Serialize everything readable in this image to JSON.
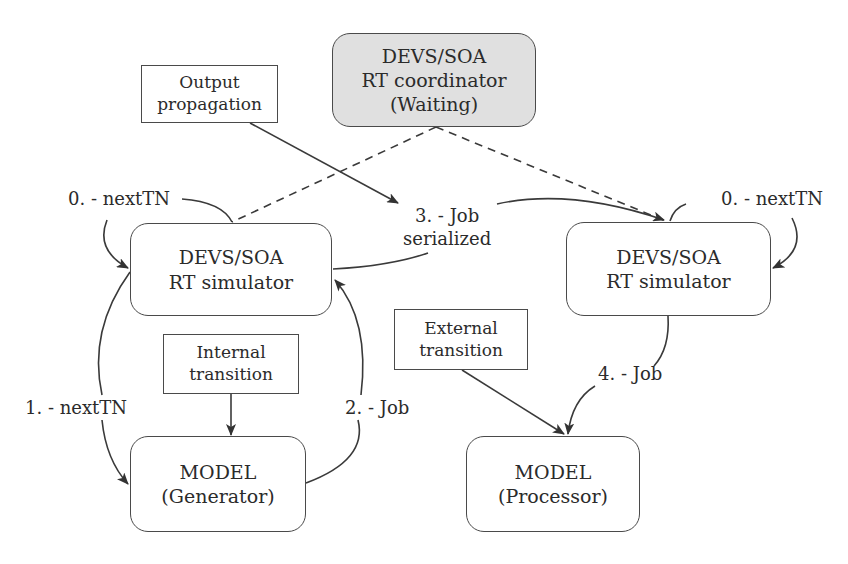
{
  "nodes": {
    "coordinator": {
      "lines": [
        "DEVS/SOA",
        "RT coordinator",
        "(Waiting)"
      ],
      "fill": "#e0e0e0"
    },
    "output_propagation": {
      "lines": [
        "Output",
        "propagation"
      ]
    },
    "left_simulator": {
      "lines": [
        "DEVS/SOA",
        "RT simulator"
      ]
    },
    "right_simulator": {
      "lines": [
        "DEVS/SOA",
        "RT simulator"
      ]
    },
    "internal_transition": {
      "lines": [
        "Internal",
        "transition"
      ]
    },
    "external_transition": {
      "lines": [
        "External",
        "transition"
      ]
    },
    "model_generator": {
      "lines": [
        "MODEL",
        "(Generator)"
      ]
    },
    "model_processor": {
      "lines": [
        "MODEL",
        "(Processor)"
      ]
    }
  },
  "edges": {
    "left_next_tn_0": "0. - nextTN",
    "right_next_tn_0": "0. - nextTN",
    "job_serialized_3": [
      "3. - Job",
      "serialized"
    ],
    "next_tn_1": "1. - nextTN",
    "job_2": "2. - Job",
    "job_4": "4. - Job"
  },
  "colors": {
    "stroke": "#3a3a3a",
    "text": "#2b2b2b",
    "coordinator_fill": "#e0e0e0"
  }
}
